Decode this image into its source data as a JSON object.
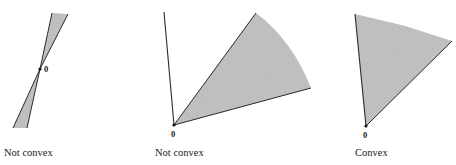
{
  "figures": [
    {
      "id": "double-cone",
      "caption": "Not convex",
      "origin_label": "0",
      "description": "Two opposite narrow shaded wedges meeting at the origin"
    },
    {
      "id": "wedge-with-ray",
      "caption": "Not convex",
      "origin_label": "0",
      "description": "Shaded wedge plus a separate ray from the origin"
    },
    {
      "id": "single-cone",
      "caption": "Convex",
      "origin_label": "0",
      "description": "Single shaded wedge from the origin"
    }
  ],
  "colors": {
    "line": "#2a2a2a",
    "fill": "#bdbdbd",
    "background": "#ffffff"
  }
}
